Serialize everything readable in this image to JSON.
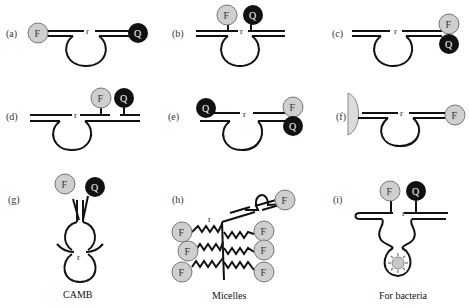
{
  "figure": {
    "panels": [
      {
        "id": "a",
        "label": "(a)",
        "fluorophore": "F",
        "quencher": "Q",
        "ribo": "r"
      },
      {
        "id": "b",
        "label": "(b)",
        "fluorophore": "F",
        "quencher": "Q",
        "ribo": "r"
      },
      {
        "id": "c",
        "label": "(c)",
        "fluorophore": "F",
        "quencher": "Q",
        "ribo": "r"
      },
      {
        "id": "d",
        "label": "(d)",
        "fluorophore": "F",
        "quencher": "Q",
        "ribo": "r"
      },
      {
        "id": "e",
        "label": "(e)",
        "fluorophore": "F",
        "quencher_left": "Q",
        "quencher_right": "Q",
        "ribo": "r"
      },
      {
        "id": "f",
        "label": "(f)",
        "fluorophore": "F",
        "ribo": "r"
      },
      {
        "id": "g",
        "label": "(g)",
        "fluorophore": "F",
        "quencher": "Q",
        "ribo": "r",
        "caption": "CAMB"
      },
      {
        "id": "h",
        "label": "(h)",
        "fluorophore": "F",
        "ribo": "r",
        "caption": "Micelles"
      },
      {
        "id": "i",
        "label": "(i)",
        "fluorophore": "F",
        "quencher": "Q",
        "ribo": "r",
        "caption": "For bacteria"
      }
    ],
    "colors": {
      "fluorophore": "#cfcfcf",
      "quencher": "#111111",
      "line": "#111111",
      "gold_surface": "#dcdcdc"
    }
  }
}
